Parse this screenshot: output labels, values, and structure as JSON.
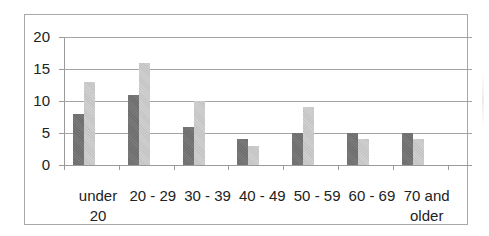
{
  "chart_data": {
    "type": "bar",
    "title": "",
    "xlabel": "",
    "ylabel": "",
    "categories": [
      "under 20",
      "20 - 29",
      "30 - 39",
      "40 - 49",
      "50 - 59",
      "60 - 69",
      "70 and older"
    ],
    "category_lines": [
      [
        "under",
        "20"
      ],
      [
        "20 - 29"
      ],
      [
        "30 - 39"
      ],
      [
        "40 - 49"
      ],
      [
        "50 - 59"
      ],
      [
        "60 - 69"
      ],
      [
        "70 and",
        "older"
      ]
    ],
    "series": [
      {
        "name": "Series 1",
        "color": "#707070",
        "values": [
          8,
          11,
          6,
          4,
          5,
          5,
          5
        ]
      },
      {
        "name": "Series 2",
        "color": "#c8c8c8",
        "values": [
          13,
          16,
          10,
          3,
          9,
          4,
          4
        ]
      }
    ],
    "ylim": [
      0,
      20
    ],
    "yticks": [
      "0",
      "5",
      "10",
      "15",
      "20"
    ],
    "grid": true,
    "legend": "none visible"
  }
}
